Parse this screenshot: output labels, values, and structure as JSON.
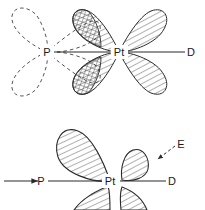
{
  "figure": {
    "type": "orbital-overlap-diagram",
    "background_color": "#ffffff",
    "line_color": "#2b2b2b",
    "hatch_color": "#3a3a3a",
    "dashed_color": "#555555"
  },
  "top_diagram": {
    "name": "phosphine-platinum-orbital-overlap",
    "atoms": [
      {
        "id": "P",
        "label": "P",
        "x": 47,
        "y": 52
      },
      {
        "id": "Pt",
        "label": "Pt",
        "x": 119,
        "y": 52
      }
    ],
    "bond_label": {
      "label": "D",
      "x": 191,
      "y": 52
    },
    "dashed_lobes_count": 4,
    "hatched_lobes_count": 4,
    "overlap_regions_count": 2
  },
  "bottom_diagram": {
    "name": "platinum-d-orbital-with-electrophile",
    "atoms": [
      {
        "id": "P",
        "label": "P",
        "x": 41,
        "y": 183
      },
      {
        "id": "Pt",
        "label": "Pt",
        "x": 110,
        "y": 183
      }
    ],
    "bond_label": {
      "label": "D",
      "x": 172,
      "y": 183
    },
    "electrophile_label": {
      "label": "E",
      "x": 181,
      "y": 148
    },
    "reaction_arrow": {
      "name": "reaction-arrow",
      "x1": 4,
      "y1": 181,
      "x2": 40,
      "y2": 181
    },
    "lobes_count": 4
  },
  "labels": {
    "P": "P",
    "Pt": "Pt",
    "D": "D",
    "E": "E"
  }
}
